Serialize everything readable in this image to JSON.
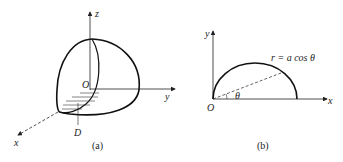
{
  "figure_a": {
    "caption": "(a)",
    "axes": {
      "z": "z",
      "y": "y",
      "x": "x"
    },
    "origin": "O",
    "region_label": "D"
  },
  "figure_b": {
    "caption": "(b)",
    "axes": {
      "y": "y",
      "x": "x"
    },
    "origin": "O",
    "angle": "θ",
    "curve_label": "r = a cos θ"
  },
  "colors": {
    "ink": "#222222",
    "background": "#ffffff"
  }
}
